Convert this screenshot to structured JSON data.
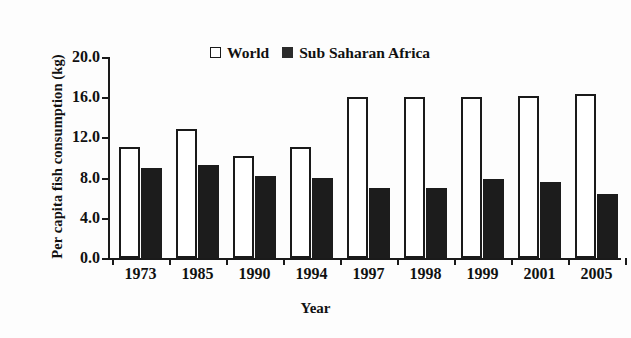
{
  "chart_data": {
    "type": "bar",
    "title": "",
    "xlabel": "Year",
    "ylabel": "Per capita fish consumption (kg)",
    "categories": [
      "1973",
      "1985",
      "1990",
      "1994",
      "1997",
      "1998",
      "1999",
      "2001",
      "2005"
    ],
    "series": [
      {
        "name": "World",
        "swatch": "open-square",
        "color": "#ffffff",
        "edge_color": "#1a1a1a",
        "values": [
          11.0,
          12.8,
          10.2,
          11.0,
          16.0,
          16.0,
          16.0,
          16.1,
          16.3
        ]
      },
      {
        "name": "Sub Saharan Africa",
        "swatch": "filled-square",
        "color": "#1c1c1c",
        "edge_color": "#1c1c1c",
        "values": [
          9.0,
          9.3,
          8.2,
          8.0,
          7.0,
          7.0,
          7.9,
          7.6,
          6.4
        ]
      }
    ],
    "ylim": [
      0.0,
      20.0
    ],
    "yticks": [
      0.0,
      4.0,
      8.0,
      12.0,
      16.0,
      20.0
    ],
    "ytick_labels": [
      "0.0",
      "4.0",
      "8.0",
      "12.0",
      "16.0",
      "20.0"
    ],
    "grid": false,
    "legend_position": "top-center"
  }
}
